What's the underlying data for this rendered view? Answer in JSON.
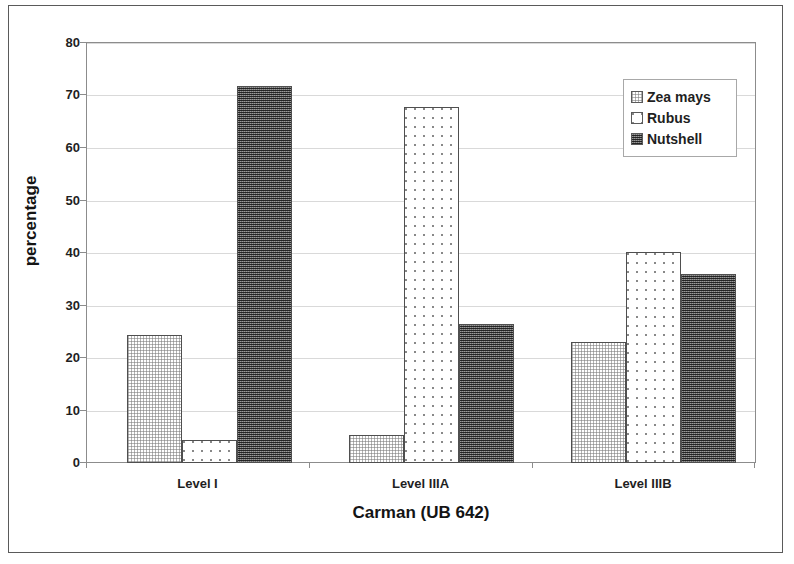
{
  "chart_data": {
    "type": "bar",
    "title": "",
    "xlabel": "Carman (UB 642)",
    "ylabel": "percentage",
    "categories": [
      "Level I",
      "Level IIIA",
      "Level IIIB"
    ],
    "series": [
      {
        "name": "Zea mays",
        "values": [
          24.3,
          5.3,
          23.1
        ],
        "pattern": "light-checker",
        "color": "#ffffff"
      },
      {
        "name": "Rubus",
        "values": [
          4.4,
          67.9,
          40.2
        ],
        "pattern": "sparse-dots",
        "color": "#ffffff"
      },
      {
        "name": "Nutshell",
        "values": [
          71.8,
          26.4,
          36.0
        ],
        "pattern": "dark-checker",
        "color": "#6d6d6d"
      }
    ],
    "ylim": [
      0,
      80
    ],
    "yticks": [
      0,
      10,
      20,
      30,
      40,
      50,
      60,
      70,
      80
    ],
    "ytick_labels": [
      "0",
      "10",
      "20",
      "30",
      "40",
      "50",
      "60",
      "70",
      "80"
    ],
    "grid": true,
    "grid_axis": "y",
    "legend_position": "top-right",
    "legend_entries": [
      "Zea mays",
      "Rubus",
      "Nutshell"
    ]
  },
  "axes": {
    "y_title": "percentage",
    "x_title": "Carman (UB 642)"
  }
}
